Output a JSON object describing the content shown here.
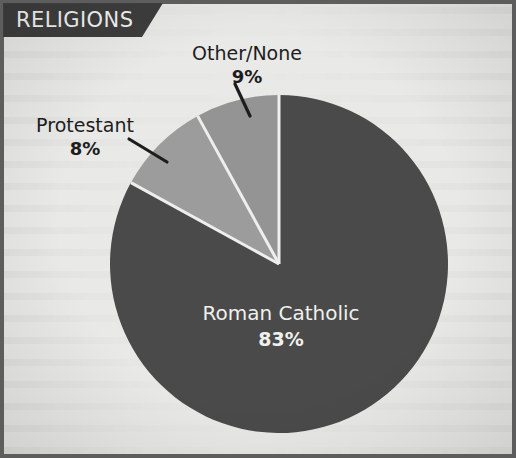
{
  "banner": {
    "title": "RELIGIONS"
  },
  "colors": {
    "background": "#e9e9e7",
    "frame": "#5d5d5d",
    "banner": "#3d3d3d",
    "banner_text": "#f2f2f0",
    "slice_catholic": "#4a4a4a",
    "slice_other": "#9c9c9c",
    "slice_protestant": "#949494",
    "slice_divider": "#eeeeec",
    "leader_line": "#1d1d1d",
    "label_text": "#1d1d1d",
    "label_text_inside": "#f0f0ee"
  },
  "labels": {
    "other": {
      "name": "Other/None",
      "pct": "9%"
    },
    "protestant": {
      "name": "Protestant",
      "pct": "8%"
    },
    "catholic": {
      "name": "Roman Catholic",
      "pct": "83%"
    }
  },
  "chart_data": {
    "type": "pie",
    "title": "RELIGIONS",
    "xlabel": "",
    "ylabel": "",
    "unit": "percent",
    "start_angle_deg": 0,
    "direction": "clockwise",
    "legend": "none",
    "grid": false,
    "labels_inside_slice": [
      "Roman Catholic"
    ],
    "categories": [
      "Roman Catholic",
      "Other/None",
      "Protestant"
    ],
    "values": [
      83,
      9,
      8
    ],
    "value_labels": [
      "83%",
      "9%",
      "8%"
    ],
    "colors": [
      "#4a4a4a",
      "#9c9c9c",
      "#949494"
    ],
    "slices": [
      {
        "label": "Roman Catholic",
        "value": 83,
        "value_label": "83%",
        "color": "#4a4a4a",
        "label_placement": "inside"
      },
      {
        "label": "Other/None",
        "value": 9,
        "value_label": "9%",
        "color": "#9c9c9c",
        "label_placement": "outside-leader"
      },
      {
        "label": "Protestant",
        "value": 8,
        "value_label": "8%",
        "color": "#949494",
        "label_placement": "outside-leader"
      }
    ],
    "total": 100
  },
  "geometry": {
    "center_x": 275,
    "center_y": 260,
    "radius": 169
  }
}
